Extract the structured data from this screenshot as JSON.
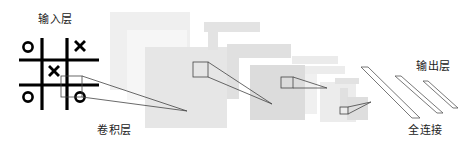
{
  "labels": {
    "input_layer": "输入层",
    "conv_layer": "卷积层",
    "fully_connected": "全连接",
    "output_layer": "输出层"
  },
  "board": {
    "cells": [
      [
        "O",
        "",
        "X"
      ],
      [
        "",
        "X",
        ""
      ],
      [
        "O",
        "",
        "O"
      ]
    ]
  },
  "colors": {
    "background": "#ffffff",
    "stroke": "#333333",
    "board_line": "#000000",
    "layer_light": "#efefef",
    "layer_mid": "#e6e6e6",
    "layer_dark": "#dcdcdc"
  }
}
